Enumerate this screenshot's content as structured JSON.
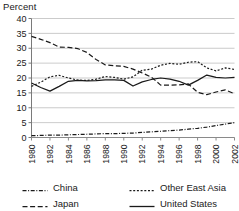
{
  "chart_data": {
    "type": "line",
    "title": "",
    "subtitle": "",
    "xlabel": "",
    "ylabel": "Percent",
    "ylim": [
      0,
      40
    ],
    "ytick_step": 5,
    "yticks": [
      0,
      5,
      10,
      15,
      20,
      25,
      30,
      35,
      40
    ],
    "xlim": [
      1980,
      2002
    ],
    "x": [
      1980,
      1981,
      1982,
      1983,
      1984,
      1985,
      1986,
      1987,
      1988,
      1989,
      1990,
      1991,
      1992,
      1993,
      1994,
      1995,
      1996,
      1997,
      1998,
      1999,
      2000,
      2001,
      2002
    ],
    "xticks": [
      1980,
      1982,
      1984,
      1986,
      1988,
      1990,
      1992,
      1994,
      1996,
      1998,
      2000,
      2002
    ],
    "xtick_labels": [
      "1980",
      "1982",
      "1984",
      "1986",
      "1988",
      "1990",
      "1992",
      "1994",
      "1996",
      "1998",
      "2000",
      "2002"
    ],
    "grid": "horizontal",
    "legend_position": "bottom",
    "series": [
      {
        "name": "China",
        "style": "dash-dot",
        "color": "#1a1a1a",
        "values": [
          0.6,
          0.7,
          0.8,
          0.8,
          0.9,
          1.0,
          1.1,
          1.2,
          1.3,
          1.3,
          1.4,
          1.5,
          1.7,
          1.9,
          2.1,
          2.3,
          2.5,
          2.8,
          3.1,
          3.5,
          4.0,
          4.5,
          5.0
        ]
      },
      {
        "name": "Other East Asia",
        "style": "dotted",
        "color": "#1a1a1a",
        "values": [
          17.2,
          18.6,
          20.4,
          20.9,
          20.0,
          19.3,
          19.2,
          19.6,
          20.5,
          20.2,
          19.6,
          20.4,
          22.6,
          23.0,
          24.3,
          24.9,
          24.6,
          25.3,
          25.5,
          23.4,
          22.4,
          23.4,
          22.9
        ]
      },
      {
        "name": "Japan",
        "style": "dashed",
        "color": "#1a1a1a",
        "values": [
          34.0,
          33.0,
          31.9,
          30.4,
          30.3,
          29.9,
          28.6,
          26.2,
          24.4,
          24.1,
          23.9,
          23.0,
          21.7,
          20.3,
          17.6,
          17.6,
          17.7,
          18.0,
          15.2,
          14.4,
          15.3,
          16.0,
          14.7
        ]
      },
      {
        "name": "United States",
        "style": "solid",
        "color": "#1a1a1a",
        "values": [
          18.3,
          16.8,
          15.6,
          17.2,
          18.9,
          19.2,
          19.0,
          19.1,
          19.4,
          19.4,
          19.2,
          17.3,
          18.7,
          19.5,
          20.0,
          19.6,
          18.9,
          17.6,
          19.2,
          21.0,
          20.2,
          20.0,
          20.2
        ]
      }
    ]
  },
  "legend": {
    "entries": [
      {
        "label": "China",
        "swatch": "dash-dot-swatch"
      },
      {
        "label": "Other East Asia",
        "swatch": "dotted-swatch"
      },
      {
        "label": "Japan",
        "swatch": "dashed-swatch"
      },
      {
        "label": "United States",
        "swatch": "solid-swatch"
      }
    ]
  }
}
